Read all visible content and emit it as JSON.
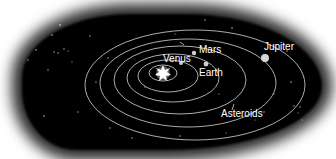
{
  "diagram": {
    "type": "solar-system",
    "colors": {
      "background": "#ffffff",
      "space": "#000000",
      "orbit": "#d8d8d8",
      "planet": "#cfcfcf",
      "sun": "#ffffff",
      "label": "#ffffff"
    },
    "sun": {
      "x": 163,
      "y": 73
    },
    "labels": {
      "venus": "Venus",
      "mars": "Mars",
      "earth": "Earth",
      "jupiter": "Jupiter",
      "asteroids": "Asteroids"
    }
  }
}
